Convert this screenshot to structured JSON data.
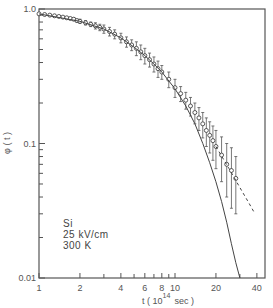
{
  "chart_data": {
    "type": "scatter",
    "title": "",
    "xlabel": "t  ( 10^14 sec )",
    "xlabel_parts": {
      "prefix": "t  ( 10",
      "exp": "14",
      "suffix": "sec )"
    },
    "ylabel": "φ ( t )",
    "xscale": "log",
    "yscale": "log",
    "xlim": [
      1,
      46
    ],
    "ylim": [
      0.01,
      1.0
    ],
    "x_ticks": [
      {
        "v": 1,
        "label": "1"
      },
      {
        "v": 2,
        "label": "2"
      },
      {
        "v": 4,
        "label": "4"
      },
      {
        "v": 6,
        "label": "6"
      },
      {
        "v": 8,
        "label": "8"
      },
      {
        "v": 10,
        "label": "10"
      },
      {
        "v": 20,
        "label": "20"
      },
      {
        "v": 40,
        "label": "40"
      }
    ],
    "x_minor_ticks": [
      3,
      5,
      7,
      9,
      30
    ],
    "y_ticks": [
      {
        "v": 1.0,
        "label": "1.0"
      },
      {
        "v": 0.1,
        "label": "0.1"
      },
      {
        "v": 0.01,
        "label": "0.01"
      }
    ],
    "y_minor_ticks": [
      0.9,
      0.8,
      0.7,
      0.6,
      0.5,
      0.4,
      0.3,
      0.2,
      0.09,
      0.08,
      0.07,
      0.06,
      0.05,
      0.04,
      0.03,
      0.02
    ],
    "grid": false,
    "annotations": [
      "Si",
      "25 kV/cm",
      "300 K"
    ],
    "series": [
      {
        "name": "Monte Carlo (points with error bars)",
        "style": "open-circle",
        "x": [
          1.0,
          1.1,
          1.2,
          1.3,
          1.4,
          1.5,
          1.6,
          1.7,
          1.8,
          1.9,
          2.0,
          2.2,
          2.4,
          2.6,
          2.8,
          3.0,
          3.3,
          3.6,
          4.0,
          4.4,
          4.8,
          5.2,
          5.6,
          6.0,
          6.5,
          7.0,
          7.5,
          8.0,
          9.0,
          10,
          11,
          12,
          13,
          14,
          15,
          16,
          17,
          18,
          19,
          20,
          22,
          24,
          26,
          28
        ],
        "y": [
          0.92,
          0.91,
          0.9,
          0.89,
          0.88,
          0.87,
          0.86,
          0.85,
          0.84,
          0.82,
          0.81,
          0.79,
          0.77,
          0.75,
          0.73,
          0.71,
          0.68,
          0.65,
          0.61,
          0.57,
          0.54,
          0.51,
          0.48,
          0.45,
          0.42,
          0.39,
          0.36,
          0.34,
          0.3,
          0.26,
          0.235,
          0.21,
          0.19,
          0.17,
          0.155,
          0.14,
          0.125,
          0.115,
          0.105,
          0.095,
          0.082,
          0.07,
          0.063,
          0.055
        ],
        "err": [
          0.0,
          0.0,
          0.0,
          0.0,
          0.0,
          0.0,
          0.0,
          0.0,
          0.02,
          0.02,
          0.03,
          0.03,
          0.03,
          0.04,
          0.04,
          0.05,
          0.05,
          0.05,
          0.05,
          0.05,
          0.05,
          0.06,
          0.06,
          0.06,
          0.05,
          0.05,
          0.05,
          0.04,
          0.04,
          0.04,
          0.03,
          0.03,
          0.03,
          0.03,
          0.03,
          0.03,
          0.03,
          0.03,
          0.03,
          0.03,
          0.03,
          0.03,
          0.03,
          0.025
        ]
      },
      {
        "name": "Theory (solid)",
        "style": "solid",
        "x": [
          1,
          2,
          3,
          4,
          5,
          6,
          7,
          8,
          10,
          12,
          14,
          16,
          18,
          20,
          22,
          24,
          26,
          28,
          30
        ],
        "y": [
          0.92,
          0.81,
          0.71,
          0.61,
          0.52,
          0.45,
          0.39,
          0.34,
          0.255,
          0.19,
          0.14,
          0.1,
          0.072,
          0.052,
          0.037,
          0.026,
          0.018,
          0.013,
          0.01
        ]
      },
      {
        "name": "Extrapolation (dashed)",
        "style": "dashed",
        "x": [
          20,
          25,
          30,
          35,
          38
        ],
        "y": [
          0.095,
          0.065,
          0.047,
          0.036,
          0.031
        ]
      }
    ]
  }
}
